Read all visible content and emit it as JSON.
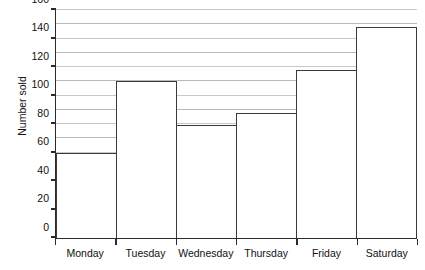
{
  "chart_data": {
    "type": "bar",
    "title": "",
    "xlabel": "",
    "ylabel": "Number sold",
    "categories": [
      "Monday",
      "Tuesday",
      "Wednesday",
      "Thursday",
      "Friday",
      "Saturday"
    ],
    "values": [
      60,
      110,
      79,
      88,
      118,
      148
    ],
    "ylim": [
      0,
      160
    ],
    "ytick_labels": [
      "0",
      "20",
      "40",
      "60",
      "80",
      "100",
      "120",
      "140",
      "160"
    ],
    "ytick_values": [
      0,
      20,
      40,
      60,
      80,
      100,
      120,
      140,
      160
    ],
    "ytick_step": 20,
    "gridline_step": 10,
    "grid": true,
    "legend": "none",
    "colors": {
      "bar_fill": "#ffffff",
      "bar_edge": "#3a3a3a",
      "axis": "#2b2b2b",
      "gridline": "#b9b9b9",
      "text": "#111111",
      "background": "#ffffff"
    }
  }
}
